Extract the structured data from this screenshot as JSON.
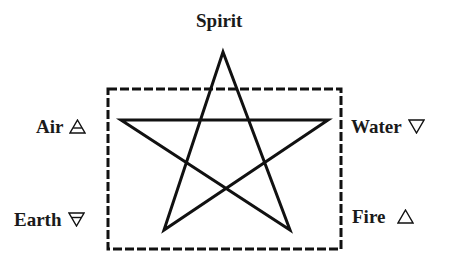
{
  "diagram": {
    "type": "pentagram-elements",
    "colors": {
      "stroke": "#111111",
      "background": "#ffffff"
    },
    "star_vertices": {
      "top": [
        223,
        52
      ],
      "upper_left": [
        121,
        120
      ],
      "upper_right": [
        328,
        120
      ],
      "lower_left": [
        164,
        230
      ],
      "lower_right": [
        290,
        230
      ]
    },
    "frame": {
      "style": "dashed",
      "x": 108,
      "y": 89,
      "width": 233,
      "height": 160
    },
    "labels": {
      "top": {
        "name": "Spirit",
        "symbol": ""
      },
      "upper_left": {
        "name": "Air",
        "symbol": "air-triangle-icon"
      },
      "upper_right": {
        "name": "Water",
        "symbol": "water-triangle-icon"
      },
      "lower_left": {
        "name": "Earth",
        "symbol": "earth-triangle-icon"
      },
      "lower_right": {
        "name": "Fire",
        "symbol": "fire-triangle-icon"
      }
    }
  }
}
